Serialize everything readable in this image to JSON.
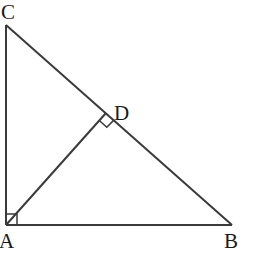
{
  "diagram": {
    "type": "geometry",
    "line_color": "#3a3a3a",
    "points": {
      "A": {
        "label": "A",
        "x": 6,
        "y": 225
      },
      "B": {
        "label": "B",
        "x": 232,
        "y": 225
      },
      "C": {
        "label": "C",
        "x": 6,
        "y": 25
      },
      "D": {
        "label": "D",
        "x": 106,
        "y": 113
      }
    },
    "segments": [
      "AB",
      "AC",
      "BC",
      "AD"
    ],
    "right_angles": [
      "A",
      "D"
    ]
  },
  "labels": {
    "A": "A",
    "B": "B",
    "C": "C",
    "D": "D"
  }
}
